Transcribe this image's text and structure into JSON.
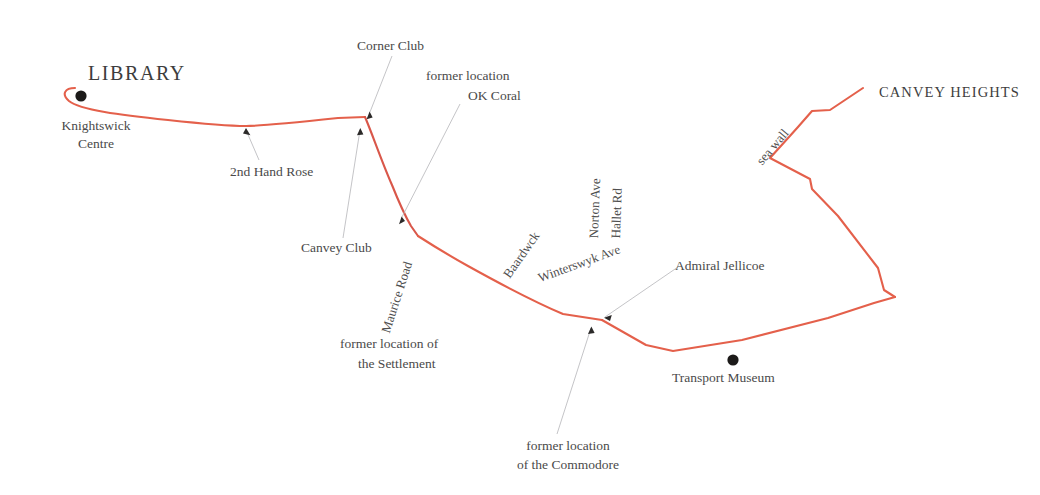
{
  "map": {
    "title": "Canvey Island walking route map",
    "background_color": "#ffffff",
    "route_color": "#e4604b",
    "leader_color": "#b9b9bd",
    "text_color": "#4a4a4a",
    "marker_color": "#1c1a19",
    "major_places": [
      {
        "id": "library",
        "label": "LIBRARY"
      },
      {
        "id": "canvey-heights",
        "label": "CANVEY HEIGHTS"
      }
    ],
    "markers": [
      {
        "id": "library-marker",
        "label": "Knightswick\nCentre"
      },
      {
        "id": "transport-museum-marker",
        "label": "Transport Museum"
      }
    ],
    "place_labels": [
      {
        "id": "knightswick-centre",
        "label": "Knightswick"
      },
      {
        "id": "knightswick-centre-2",
        "label": "Centre"
      },
      {
        "id": "second-hand-rose",
        "label": "2nd Hand Rose"
      },
      {
        "id": "corner-club",
        "label": "Corner Club"
      },
      {
        "id": "canvey-club",
        "label": "Canvey Club"
      },
      {
        "id": "admiral-jellicoe",
        "label": "Admiral Jellicoe"
      },
      {
        "id": "transport-museum",
        "label": "Transport Museum"
      }
    ],
    "annotations": [
      {
        "id": "ok-coral",
        "line1": "former location",
        "line2": "OK Coral"
      },
      {
        "id": "settlement",
        "line1": "former location of",
        "line2": "the Settlement"
      },
      {
        "id": "commodore",
        "line1": "former location",
        "line2": "of the Commodore"
      }
    ],
    "streets": [
      {
        "id": "maurice-road",
        "label": "Maurice Road",
        "rotation": "-72"
      },
      {
        "id": "baardwck",
        "label": "Baardwck",
        "rotation": "-55"
      },
      {
        "id": "winterswyk-ave",
        "label": "Winterswyk Ave",
        "rotation": "-20"
      },
      {
        "id": "norton-ave",
        "label": "Norton Ave",
        "rotation": "-88"
      },
      {
        "id": "hallet-rd",
        "label": "Hallet Rd",
        "rotation": "-88"
      },
      {
        "id": "sea-wall",
        "label": "sea wall",
        "rotation": "-50"
      }
    ]
  }
}
